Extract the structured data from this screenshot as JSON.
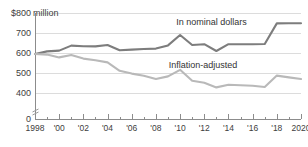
{
  "chart_data": {
    "type": "line",
    "title": "",
    "xlabel": "",
    "ylabel": "$800 million",
    "y_unit_label": "$800 million",
    "ylim": [
      400,
      800
    ],
    "y_ticks": [
      400,
      500,
      600,
      700,
      800
    ],
    "y_tick_labels": [
      "400",
      "500",
      "600",
      "700",
      "$800 million"
    ],
    "zero_label": "0",
    "axis_break": true,
    "grid": true,
    "legend": "inline-labels",
    "x": [
      1998,
      1999,
      2000,
      2001,
      2002,
      2003,
      2004,
      2005,
      2006,
      2007,
      2008,
      2009,
      2010,
      2011,
      2012,
      2013,
      2014,
      2015,
      2016,
      2017,
      2018,
      2019,
      2020
    ],
    "xlim": [
      1998,
      2020
    ],
    "x_tick_labels": [
      "1998",
      "'00",
      "'02",
      "'04",
      "'06",
      "'08",
      "'10",
      "'12",
      "'14",
      "'16",
      "'18",
      "2020"
    ],
    "x_tick_years": [
      1998,
      2000,
      2002,
      2004,
      2006,
      2008,
      2010,
      2012,
      2014,
      2016,
      2018,
      2020
    ],
    "series": [
      {
        "name": "In nominal dollars",
        "color": "#7d7d7d",
        "label_x": 2012.6,
        "label_y": 738,
        "values": [
          595,
          608,
          612,
          637,
          634,
          633,
          640,
          614,
          617,
          620,
          622,
          638,
          690,
          640,
          644,
          610,
          644,
          644,
          644,
          645,
          748,
          749,
          749
        ]
      },
      {
        "name": "Inflation-adjusted",
        "color": "#b9b9b9",
        "label_x": 2011.9,
        "label_y": 524,
        "values": [
          595,
          592,
          578,
          590,
          572,
          564,
          553,
          511,
          497,
          486,
          470,
          483,
          516,
          461,
          451,
          428,
          441,
          439,
          436,
          430,
          487,
          478,
          470
        ]
      }
    ]
  }
}
